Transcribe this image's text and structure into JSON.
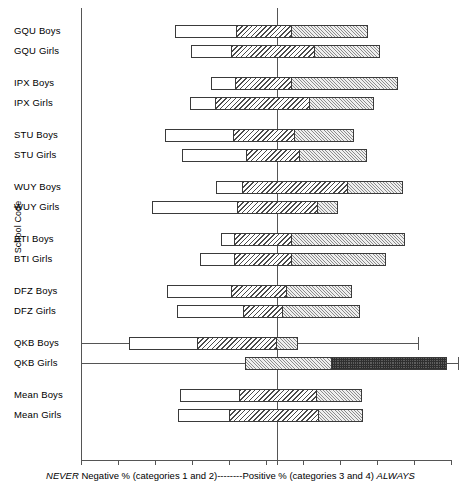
{
  "axes": {
    "ylabel": "School Code",
    "xcaption_prefix": "NEVER",
    "xcaption_mid": " Negative % (categories 1 and 2)--------Positive % (categories 3 and 4) ",
    "xcaption_suffix": "ALWAYS"
  },
  "chart_data": {
    "type": "bar",
    "subtype": "diverging-stacked-bar",
    "title": "",
    "xlabel": "NEVER Negative % (categories 1 and 2)--------Positive % (categories 3 and 4) ALWAYS",
    "ylabel": "School Code",
    "grid": false,
    "legend_position": "none",
    "xlim": [
      -106,
      94
    ],
    "xticks": [
      -106,
      -86,
      -66,
      -46,
      -26,
      -6,
      0,
      14,
      34,
      54,
      74,
      94
    ],
    "zero_reference": 0,
    "series": [
      {
        "name": "category 1",
        "pattern": "white"
      },
      {
        "name": "category 2",
        "pattern": "diagonal-hatch"
      },
      {
        "name": "category 3",
        "pattern": "fine-light-hatch"
      },
      {
        "name": "category 4",
        "pattern": "dark-checkerboard"
      }
    ],
    "categories": [
      "GQU Boys",
      "GQU Girls",
      "IPX Boys",
      "IPX Girls",
      "STU Boys",
      "STU Girls",
      "WUY Boys",
      "WUY Girls",
      "BTI Boys",
      "BTI Girls",
      "DFZ Boys",
      "DFZ Girls",
      "QKB Boys",
      "QKB Girls",
      "Mean Boys",
      "Mean Girls"
    ],
    "groups": [
      {
        "label": "GQU Boys",
        "group": "GQU",
        "sex": "Boys",
        "neg_start_px": 175,
        "segments_px": [
          175,
          237,
          292,
          368
        ],
        "bar_end_px": 368,
        "values": {
          "cat1": 33.5,
          "cat2": 29.7,
          "cat3": 29.7,
          "cat4": 41.1
        },
        "negative_total": -55.1,
        "positive_total": 49.2
      },
      {
        "label": "GQU Girls",
        "group": "GQU",
        "sex": "Girls",
        "neg_start_px": 191,
        "segments_px": [
          191,
          232,
          315,
          380
        ],
        "bar_end_px": 380,
        "values": {
          "cat1": 22.2,
          "cat2": 44.9,
          "cat3": 20.5,
          "cat4": 35.1
        },
        "negative_total": -46.5,
        "positive_total": 55.7
      },
      {
        "label": "IPX Boys",
        "group": "IPX",
        "sex": "Boys",
        "neg_start_px": 211,
        "segments_px": [
          211,
          236,
          292,
          398
        ],
        "bar_end_px": 398,
        "values": {
          "cat1": 13.5,
          "cat2": 30.3,
          "cat3": 8.1,
          "cat4": 57.3
        },
        "negative_total": -35.7,
        "positive_total": 65.4
      },
      {
        "label": "IPX Girls",
        "group": "IPX",
        "sex": "Girls",
        "neg_start_px": 190,
        "segments_px": [
          190,
          216,
          310,
          374
        ],
        "bar_end_px": 374,
        "values": {
          "cat1": 14.1,
          "cat2": 50.8,
          "cat3": 17.8,
          "cat4": 34.6
        },
        "negative_total": -47.0,
        "positive_total": 52.4
      },
      {
        "label": "STU Boys",
        "group": "STU",
        "sex": "Boys",
        "neg_start_px": 165,
        "segments_px": [
          165,
          234,
          295,
          354
        ],
        "bar_end_px": 354,
        "values": {
          "cat1": 37.3,
          "cat2": 33.0,
          "cat3": 9.7,
          "cat4": 31.9
        },
        "negative_total": -60.5,
        "positive_total": 41.6
      },
      {
        "label": "STU Girls",
        "group": "STU",
        "sex": "Girls",
        "neg_start_px": 182,
        "segments_px": [
          182,
          247,
          300,
          367
        ],
        "bar_end_px": 367,
        "values": {
          "cat1": 35.1,
          "cat2": 16.2,
          "cat3": 12.4,
          "cat4": 36.2
        },
        "negative_total": -51.4,
        "positive_total": 48.6
      },
      {
        "label": "WUY Boys",
        "group": "WUY",
        "sex": "Boys",
        "neg_start_px": 216,
        "segments_px": [
          216,
          243,
          348,
          403
        ],
        "bar_end_px": 403,
        "values": {
          "cat1": 14.6,
          "cat2": 18.4,
          "cat3": 38.4,
          "cat4": 29.7
        },
        "negative_total": -33.0,
        "positive_total": 68.1
      },
      {
        "label": "WUY Girls",
        "group": "WUY",
        "sex": "Girls",
        "neg_start_px": 152,
        "segments_px": [
          152,
          238,
          318,
          338
        ],
        "bar_end_px": 338,
        "values": {
          "cat1": 46.5,
          "cat2": 21.1,
          "cat3": 22.2,
          "cat4": 10.8
        },
        "negative_total": -67.6,
        "positive_total": 33.0
      },
      {
        "label": "BTI Boys",
        "group": "BTI",
        "sex": "Boys",
        "neg_start_px": 221,
        "segments_px": [
          221,
          235,
          292,
          405
        ],
        "bar_end_px": 405,
        "values": {
          "cat1": 7.6,
          "cat2": 22.7,
          "cat3": 8.1,
          "cat4": 61.1
        },
        "negative_total": -30.3,
        "positive_total": 69.2
      },
      {
        "label": "BTI Girls",
        "group": "BTI",
        "sex": "Girls",
        "neg_start_px": 200,
        "segments_px": [
          200,
          235,
          292,
          386
        ],
        "bar_end_px": 386,
        "values": {
          "cat1": 18.9,
          "cat2": 22.7,
          "cat3": 8.1,
          "cat4": 50.8
        },
        "negative_total": -41.6,
        "positive_total": 58.9
      },
      {
        "label": "DFZ Boys",
        "group": "DFZ",
        "sex": "Boys",
        "neg_start_px": 167,
        "segments_px": [
          167,
          232,
          287,
          352
        ],
        "bar_end_px": 352,
        "values": {
          "cat1": 35.1,
          "cat2": 24.3,
          "cat3": 5.4,
          "cat4": 35.1
        },
        "negative_total": -59.5,
        "positive_total": 40.5
      },
      {
        "label": "DFZ Girls",
        "group": "DFZ",
        "sex": "Girls",
        "neg_start_px": 177,
        "segments_px": [
          177,
          244,
          283,
          360
        ],
        "bar_end_px": 360,
        "values": {
          "cat1": 36.2,
          "cat2": 17.8,
          "cat3": 3.2,
          "cat4": 41.6
        },
        "negative_total": -54.1,
        "positive_total": 44.9
      },
      {
        "label": "QKB Boys",
        "group": "QKB",
        "sex": "Boys",
        "neg_start_px": 129,
        "segments_px": [
          129,
          198,
          277,
          298
        ],
        "bar_end_px": 298,
        "whisker_from_px": 81,
        "whisker_to_px": 418,
        "values": {
          "cat1": 37.3,
          "cat2": 42.7,
          "cat3": 0.0,
          "cat4": 11.4
        },
        "negative_total": -80.0,
        "positive_total": 11.4
      },
      {
        "label": "QKB Girls",
        "group": "QKB",
        "sex": "Girls",
        "neg_start_px": 245,
        "segments_px": [
          245,
          245,
          245,
          332
        ],
        "bar_end_px": 447,
        "whisker_from_px": 81,
        "whisker_to_px": 458,
        "values": {
          "cat1": 0.0,
          "cat2": 17.3,
          "cat3": 47.0,
          "cat4": 62.2
        },
        "negative_total": -17.3,
        "positive_total": 92.0
      },
      {
        "label": "Mean Boys",
        "group": "Mean",
        "sex": "Boys",
        "neg_start_px": 180,
        "segments_px": [
          180,
          240,
          317,
          362
        ],
        "bar_end_px": 362,
        "values": {
          "cat1": 32.4,
          "cat2": 20.0,
          "cat3": 21.6,
          "cat4": 24.3
        },
        "negative_total": -52.4,
        "positive_total": 45.9
      },
      {
        "label": "Mean Girls",
        "group": "Mean",
        "sex": "Girls",
        "neg_start_px": 178,
        "segments_px": [
          178,
          230,
          319,
          363
        ],
        "bar_end_px": 363,
        "values": {
          "cat1": 28.1,
          "cat2": 25.4,
          "cat3": 22.7,
          "cat4": 23.8
        },
        "negative_total": -53.5,
        "positive_total": 46.5
      }
    ]
  }
}
